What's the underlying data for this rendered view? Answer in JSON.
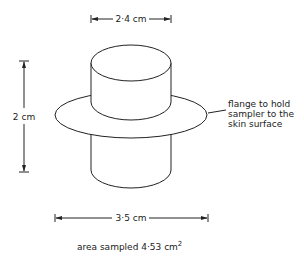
{
  "diagram": {
    "type": "technical-sketch",
    "dimensions": {
      "top_diameter": "2·4 cm",
      "height": "2 cm",
      "flange_diameter": "3·5 cm"
    },
    "annotation": {
      "lines": [
        "flange to hold",
        "sampler to the",
        "skin surface"
      ]
    },
    "caption": {
      "prefix": "area sampled 4·53 cm",
      "superscript": "2"
    },
    "colors": {
      "stroke": "#222222",
      "background": "#ffffff"
    }
  }
}
